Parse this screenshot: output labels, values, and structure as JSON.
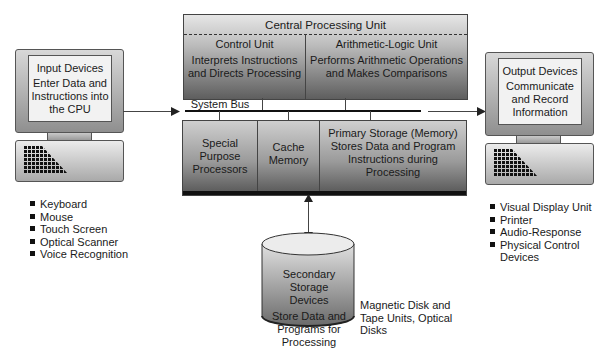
{
  "cpu": {
    "title": "Central Processing Unit",
    "control_unit": {
      "title": "Control Unit",
      "desc": "Interprets Instructions and Directs Processing"
    },
    "alu": {
      "title": "Arithmetic-Logic Unit",
      "desc": "Performs Arithmetic Operations and Makes Comparisons"
    },
    "system_bus": "System Bus",
    "special_purpose": "Special Purpose Processors",
    "cache": "Cache Memory",
    "primary_storage": "Primary Storage (Memory) Stores Data and Program Instructions during Processing"
  },
  "input": {
    "title": "Input Devices",
    "desc": "Enter Data and Instructions into the CPU",
    "items": [
      "Keyboard",
      "Mouse",
      "Touch Screen",
      "Optical Scanner",
      "Voice Recognition"
    ]
  },
  "output": {
    "title": "Output Devices",
    "desc": "Communicate and Record Information",
    "items": [
      "Visual Display Unit",
      "Printer",
      "Audio-Response",
      "Physical Control Devices"
    ]
  },
  "secondary": {
    "title": "Secondary Storage Devices",
    "desc": "Store Data and Programs for Processing",
    "examples": "Magnetic Disk and Tape Units, Optical Disks"
  },
  "colors": {
    "line": "#444444",
    "screen": "#f2f2f2",
    "dark_band": "#111111"
  }
}
